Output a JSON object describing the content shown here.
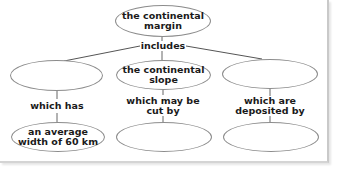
{
  "concept_map": {
    "root": {
      "text": "the continental\nmargin"
    },
    "root_link": {
      "text": "includes"
    },
    "branches": [
      {
        "concept": {
          "text": ""
        },
        "link": {
          "text": "which has"
        },
        "detail": {
          "text": "an average\nwidth of 60 km"
        }
      },
      {
        "concept": {
          "text": "the continental\nslope"
        },
        "link": {
          "text": "which may be\ncut by"
        },
        "detail": {
          "text": ""
        }
      },
      {
        "concept": {
          "text": ""
        },
        "link": {
          "text": "which are\ndeposited by"
        },
        "detail": {
          "text": ""
        }
      }
    ]
  },
  "colors": {
    "line": "#555555",
    "outline": "#8c8c8c",
    "text": "#1a1a1a"
  }
}
